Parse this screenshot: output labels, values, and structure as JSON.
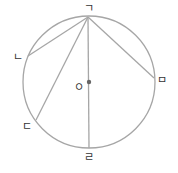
{
  "diagram": {
    "type": "circle-with-chords",
    "circle": {
      "cx": 89,
      "cy": 82,
      "r": 66,
      "stroke": "#a6a6a6"
    },
    "center": {
      "label": "ㅇ",
      "x": 89,
      "y": 82,
      "label_x": 79,
      "label_y": 88
    },
    "points": [
      {
        "id": "giyeok",
        "label": "ㄱ",
        "x": 88,
        "y": 17,
        "label_x": 89,
        "label_y": 9
      },
      {
        "id": "nieun",
        "label": "ㄴ",
        "x": 28,
        "y": 56,
        "label_x": 18,
        "label_y": 58
      },
      {
        "id": "digeut",
        "label": "ㄷ",
        "x": 36,
        "y": 120,
        "label_x": 27,
        "label_y": 127
      },
      {
        "id": "rieul",
        "label": "ㄹ",
        "x": 89,
        "y": 148,
        "label_x": 89,
        "label_y": 158
      },
      {
        "id": "mieum",
        "label": "ㅁ",
        "x": 154,
        "y": 78,
        "label_x": 162,
        "label_y": 81
      }
    ],
    "segments": [
      {
        "from": "ㄱ",
        "to": "ㄴ"
      },
      {
        "from": "ㄱ",
        "to": "ㄷ"
      },
      {
        "from": "ㄱ",
        "to": "ㄹ"
      },
      {
        "from": "ㄱ",
        "to": "ㅁ"
      }
    ]
  }
}
